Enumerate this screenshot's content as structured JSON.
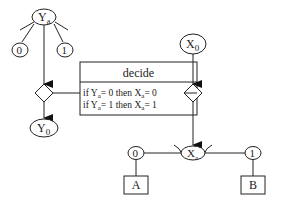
{
  "diagram": {
    "stroke_color": "#222222",
    "background": "#ffffff",
    "nodes": {
      "ya": {
        "label": "Y",
        "sub": "a"
      },
      "ya_opt0": {
        "label": "0"
      },
      "ya_opt1": {
        "label": "1"
      },
      "y0": {
        "label": "Y",
        "sub": "0"
      },
      "x0": {
        "label": "X",
        "sub": "0"
      },
      "xa": {
        "label": "X",
        "sub": "a"
      },
      "xa_opt0": {
        "label": "0"
      },
      "xa_opt1": {
        "label": "1"
      },
      "box_a": {
        "label": "A"
      },
      "box_b": {
        "label": "B"
      }
    },
    "decide_box": {
      "title": "decide",
      "rules": [
        {
          "if_var": "Y",
          "if_sub": "a",
          "if_val": "= 0 then ",
          "then_var": "X",
          "then_sub": "a",
          "then_val": "= 0",
          "prefix": "if "
        },
        {
          "if_var": "Y",
          "if_sub": "a",
          "if_val": "= 1 then ",
          "then_var": "X",
          "then_sub": "a",
          "then_val": "= 1",
          "prefix": "if "
        }
      ]
    }
  }
}
